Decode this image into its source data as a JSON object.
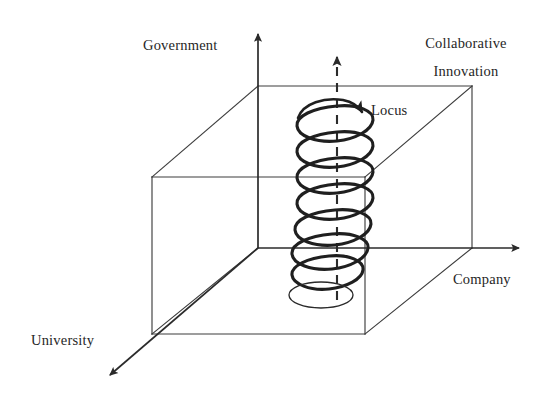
{
  "figure": {
    "type": "3d-axes-diagram",
    "background_color": "#ffffff",
    "line_color": "#3a3a3a",
    "helix_color": "#1f1f1f",
    "text_color": "#262626"
  },
  "axes": {
    "vertical": {
      "label": "Government",
      "direction": "up",
      "arrow": true,
      "origin": {
        "x": 258,
        "y": 248
      },
      "tip": {
        "x": 258,
        "y": 28
      }
    },
    "horizontal": {
      "label": "Company",
      "direction": "right",
      "arrow": true,
      "origin": {
        "x": 258,
        "y": 248
      },
      "tip": {
        "x": 527,
        "y": 248
      }
    },
    "depth": {
      "label": "University",
      "direction": "down-left",
      "arrow": true,
      "origin": {
        "x": 258,
        "y": 248
      },
      "tip": {
        "x": 103,
        "y": 381
      }
    }
  },
  "box": {
    "name": "innovation-space-cube",
    "corner_label": "Collaborative Innovation",
    "front_face": {
      "top_left": {
        "x": 152,
        "y": 177
      },
      "top_right": {
        "x": 365,
        "y": 177
      },
      "bottom_right": {
        "x": 365,
        "y": 334
      },
      "bottom_left": {
        "x": 152,
        "y": 334
      }
    },
    "back_face": {
      "top_left": {
        "x": 258,
        "y": 86
      },
      "top_right": {
        "x": 472,
        "y": 86
      },
      "bottom_right": {
        "x": 472,
        "y": 248
      },
      "bottom_left": {
        "x": 258,
        "y": 248
      }
    }
  },
  "helix": {
    "name": "collaborative-innovation-locus-helix",
    "turns": 7,
    "center_x": 337,
    "top_y": 106,
    "bottom_y": 288,
    "radius_x": 37,
    "radius_y": 13,
    "stroke_width": 3.1,
    "axis_line": {
      "style": "dashed",
      "x": 337,
      "top_y": 50,
      "bottom_y": 300,
      "arrow": true,
      "dash_pattern": "9 7"
    },
    "base_ellipse": {
      "center_x": 321,
      "center_y": 295,
      "radius_x": 32,
      "radius_y": 13,
      "stroke_width": 1.3
    }
  },
  "annotations": {
    "locus": {
      "label": "Locus",
      "arrow": {
        "description": "curved arrow over top helix turn pointing down-right",
        "start": {
          "x": 300,
          "y": 111
        },
        "end": {
          "x": 363,
          "y": 113
        }
      }
    }
  },
  "labels": {
    "government": "Government",
    "collaborative": "Collaborative",
    "innovation": "Innovation",
    "university": "University",
    "company": "Company",
    "locus": "Locus"
  }
}
